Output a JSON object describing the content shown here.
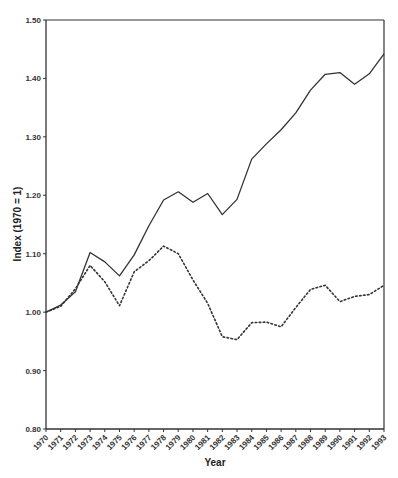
{
  "chart_data": {
    "type": "line",
    "title": "",
    "xlabel": "Year",
    "ylabel": "Index (1970 = 1)",
    "ylim": [
      0.8,
      1.5
    ],
    "yticks": [
      "0.80",
      "0.90",
      "1.00",
      "1.10",
      "1.20",
      "1.30",
      "1.40",
      "1.50"
    ],
    "x": [
      1970,
      1971,
      1972,
      1973,
      1974,
      1975,
      1976,
      1977,
      1978,
      1979,
      1980,
      1981,
      1982,
      1983,
      1984,
      1985,
      1986,
      1987,
      1988,
      1989,
      1990,
      1991,
      1992,
      1993
    ],
    "grid": false,
    "legend": "none",
    "series": [
      {
        "name": "Solid line",
        "style": "solid",
        "color": "#333333",
        "values": [
          1.0,
          1.012,
          1.035,
          1.102,
          1.086,
          1.062,
          1.098,
          1.148,
          1.192,
          1.206,
          1.188,
          1.203,
          1.167,
          1.193,
          1.262,
          1.288,
          1.312,
          1.341,
          1.38,
          1.407,
          1.41,
          1.39,
          1.408,
          1.442
        ]
      },
      {
        "name": "Dotted line",
        "style": "dotted",
        "color": "#333333",
        "values": [
          1.0,
          1.01,
          1.04,
          1.08,
          1.052,
          1.011,
          1.069,
          1.088,
          1.113,
          1.1,
          1.055,
          1.015,
          0.958,
          0.953,
          0.982,
          0.983,
          0.975,
          1.008,
          1.039,
          1.046,
          1.018,
          1.027,
          1.03,
          1.046
        ]
      }
    ]
  }
}
